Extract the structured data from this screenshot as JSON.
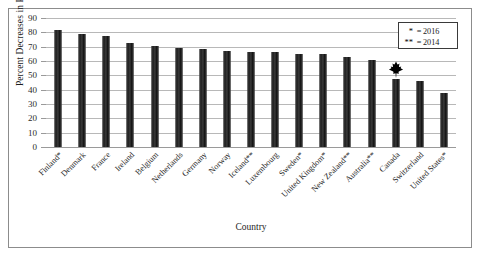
{
  "chart_data": {
    "type": "bar",
    "title": "",
    "xlabel": "Country",
    "ylabel": "Percent Decreases in Poverty Rate",
    "ylim": [
      0,
      90
    ],
    "ytick_step": 10,
    "yticks": [
      0,
      10,
      20,
      30,
      40,
      50,
      60,
      70,
      80,
      90
    ],
    "grid": true,
    "legend_position": "top-right",
    "bar_color": "#2e2e2e",
    "categories": [
      "Finland*",
      "Denmark",
      "France",
      "Ireland",
      "Belgium",
      "Netherlands",
      "Germany",
      "Norway",
      "Iceland**",
      "Luxembourg",
      "Sweden*",
      "United Kingdom*",
      "New Zealand**",
      "Australia**",
      "Canada",
      "Switzerland",
      "United States*"
    ],
    "values": [
      81.5,
      78.5,
      77.5,
      72.5,
      70.5,
      69,
      68.5,
      67,
      66.5,
      66.5,
      65,
      65,
      63,
      61,
      47.5,
      46,
      38
    ],
    "annotations": [
      {
        "category": "Canada",
        "marker": "maple-leaf-icon",
        "color": "#000000"
      }
    ],
    "legend": [
      {
        "symbol": "*",
        "label": "= 2016",
        "equals": "=",
        "value": "2016"
      },
      {
        "symbol": "**",
        "label": "= 2014",
        "equals": "=",
        "value": "2014"
      }
    ]
  },
  "legend_rows": [
    {
      "symbol": "*",
      "equals": "=",
      "value": "2016"
    },
    {
      "symbol": "**",
      "equals": "=",
      "value": "2014"
    }
  ]
}
